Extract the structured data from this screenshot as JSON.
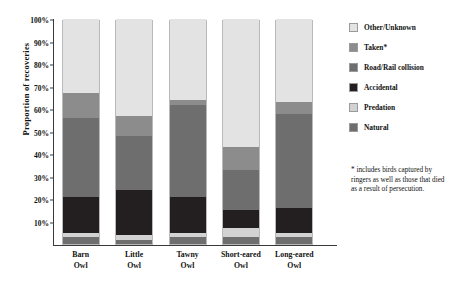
{
  "chart_data": {
    "type": "bar",
    "subtype": "stacked-100-percent",
    "title": "",
    "xlabel": "",
    "ylabel": "Proportion of recoveries",
    "ylim": [
      0,
      100
    ],
    "ytick_labels": [
      "100%",
      "90%",
      "80%",
      "70%",
      "60%",
      "50%",
      "40%",
      "30%",
      "20%",
      "10%"
    ],
    "ytick_values": [
      100,
      90,
      80,
      70,
      60,
      50,
      40,
      30,
      20,
      10
    ],
    "grid": false,
    "legend_position": "right",
    "categories": [
      "Barn Owl",
      "Little Owl",
      "Tawny Owl",
      "Short-eared Owl",
      "Long-eared Owl"
    ],
    "category_lines": [
      [
        "Barn",
        "Owl"
      ],
      [
        "Little",
        "Owl"
      ],
      [
        "Tawny",
        "Owl"
      ],
      [
        "Short-eared",
        "Owl"
      ],
      [
        "Long-eared",
        "Owl"
      ]
    ],
    "stack_order_bottom_to_top": [
      "Natural",
      "Predation",
      "Accidental",
      "Road/Rail collision",
      "Taken*",
      "Other/Unknown"
    ],
    "series": [
      {
        "name": "Natural",
        "color": "#6e6e6e",
        "values": [
          3,
          2,
          3,
          3,
          3
        ]
      },
      {
        "name": "Predation",
        "color": "#d2d2d2",
        "values": [
          2,
          2,
          2,
          4,
          2
        ]
      },
      {
        "name": "Accidental",
        "color": "#231f20",
        "values": [
          16,
          20,
          16,
          8,
          11
        ]
      },
      {
        "name": "Road/Rail collision",
        "color": "#6e6e6e",
        "values": [
          35,
          24,
          41,
          18,
          42
        ]
      },
      {
        "name": "Taken*",
        "color": "#8c8c8c",
        "values": [
          11,
          9,
          2,
          10,
          5
        ]
      },
      {
        "name": "Other/Unknown",
        "color": "#e3e3e3",
        "values": [
          33,
          43,
          36,
          57,
          37
        ]
      }
    ],
    "annotations": [
      "* includes birds captured by ringers as well as those that died as a result of persecution."
    ]
  },
  "legend": {
    "items": [
      {
        "label": "Other/Unknown",
        "color": "#e3e3e3"
      },
      {
        "label": "Taken*",
        "color": "#8c8c8c"
      },
      {
        "label": "Road/Rail collision",
        "color": "#6e6e6e"
      },
      {
        "label": "Accidental",
        "color": "#231f20"
      },
      {
        "label": "Predation",
        "color": "#d2d2d2"
      },
      {
        "label": "Natural",
        "color": "#6e6e6e"
      }
    ]
  },
  "footnote": {
    "text": "* includes birds captured by ringers as well as those that died as a result of persecution."
  }
}
